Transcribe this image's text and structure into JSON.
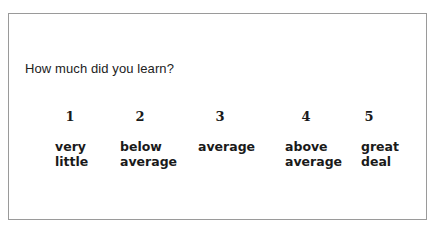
{
  "question": "How much did you learn?",
  "scale": [
    {
      "value": "1",
      "lines": [
        "very",
        "little"
      ]
    },
    {
      "value": "2",
      "lines": [
        "below",
        "average"
      ]
    },
    {
      "value": "3",
      "lines": [
        "average"
      ]
    },
    {
      "value": "4",
      "lines": [
        "above",
        "average"
      ]
    },
    {
      "value": "5",
      "lines": [
        "great",
        "deal"
      ]
    }
  ],
  "colors": {
    "border": "#9a9a9a",
    "text": "#1a1a1a"
  }
}
